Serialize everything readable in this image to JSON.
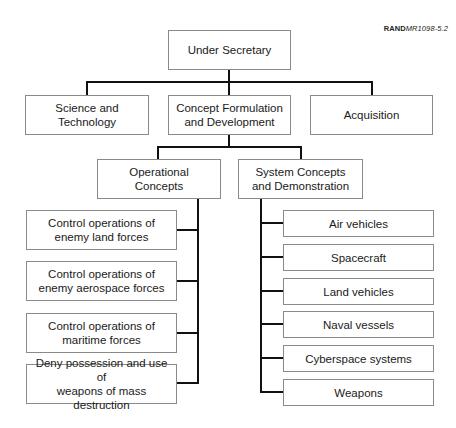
{
  "figure_ref": {
    "brand": "RAND",
    "code": "MR1098-5.2"
  },
  "org_chart": {
    "root": {
      "label": "Under Secretary"
    },
    "level1": [
      {
        "label": "Science and\nTechnology"
      },
      {
        "label": "Concept Formulation\nand Development"
      },
      {
        "label": "Acquisition"
      }
    ],
    "level2": [
      {
        "label": "Operational\nConcepts"
      },
      {
        "label": "System Concepts\nand Demonstration"
      }
    ],
    "operational_concepts": [
      {
        "label": "Control operations of\nenemy land forces"
      },
      {
        "label": "Control operations of\nenemy aerospace forces"
      },
      {
        "label": "Control operations of\nmaritime forces"
      },
      {
        "label": "Deny possession and use of\nweapons of mass destruction"
      }
    ],
    "system_concepts": [
      {
        "label": "Air vehicles"
      },
      {
        "label": "Spacecraft"
      },
      {
        "label": "Land vehicles"
      },
      {
        "label": "Naval vessels"
      },
      {
        "label": "Cyberspace systems"
      },
      {
        "label": "Weapons"
      }
    ]
  }
}
